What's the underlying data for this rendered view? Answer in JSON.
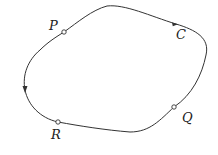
{
  "diagram": {
    "type": "closed-curve",
    "curve": {
      "label": "C",
      "direction": "counterclockwise"
    },
    "points": [
      {
        "id": "P",
        "label": "P",
        "x": 64,
        "y": 32,
        "lx": 49,
        "ly": 30
      },
      {
        "id": "Q",
        "label": "Q",
        "x": 174,
        "y": 107,
        "lx": 182,
        "ly": 122
      },
      {
        "id": "R",
        "label": "R",
        "x": 58,
        "y": 122,
        "lx": 51,
        "ly": 139
      }
    ],
    "curve_label": {
      "text": "C",
      "x": 176,
      "y": 39
    },
    "colors": {
      "stroke": "#333333",
      "background": "#ffffff"
    }
  }
}
